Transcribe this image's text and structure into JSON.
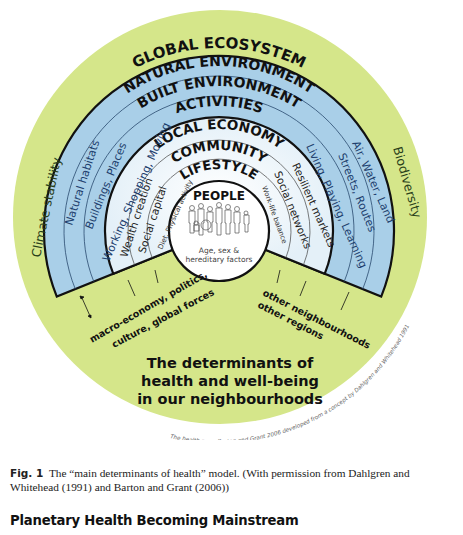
{
  "diagram": {
    "title_lines": [
      "The determinants of",
      "health and well-being",
      "in our neighbourhoods"
    ],
    "outer_ring": {
      "label": "GLOBAL ECOSYSTEM",
      "left_label": "Climate stability",
      "right_label": "Biodiversity",
      "color": "#d5e68a"
    },
    "blue_rings": {
      "color": "#a9cfe8",
      "labels": [
        "NATURAL ENVIRONMENT",
        "BUILT ENVIRONMENT",
        "ACTIVITIES"
      ],
      "left_items": [
        "Natural habitats",
        "Buildings, Places",
        "Working, Shopping, Moving"
      ],
      "right_items": [
        "Air, Water, Land",
        "Streets, Routes",
        "Living, Playing, Learning"
      ]
    },
    "inner_rings": {
      "color": "#eef6fb",
      "labels": [
        "LOCAL ECONOMY",
        "COMMUNITY",
        "LIFESTYLE"
      ],
      "left_items": [
        "Wealth creation",
        "Social capital",
        "Diet, Physical activity"
      ],
      "right_items": [
        "Resilient markets",
        "Social networks",
        "Work-life balance"
      ]
    },
    "core": {
      "label": "PEOPLE",
      "sub_line1": "Age, sex &",
      "sub_line2": "hereditary factors"
    },
    "external_left": [
      "macro-economy, politics,",
      "culture, global forces"
    ],
    "external_right": [
      "other neighbourhoods",
      "other regions"
    ],
    "credit": "The health map: Barton and Grant 2006 developed from a concept by Dahlgren and Whitehead 1991"
  },
  "caption": {
    "fig_label": "Fig. 1",
    "text": "The “main determinants of health” model. (With permission from Dahlgren and Whitehead (1991) and Barton and Grant (2006))"
  },
  "section_heading": "Planetary Health Becoming Mainstream"
}
